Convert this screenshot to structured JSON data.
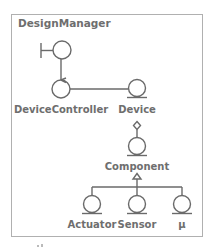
{
  "diagram": {
    "package_title": "DesignManager",
    "nodes": {
      "boundary": {
        "type": "boundary",
        "label": ""
      },
      "controller": {
        "type": "control",
        "label": "DeviceController"
      },
      "device": {
        "type": "entity",
        "label": "Device"
      },
      "component": {
        "type": "entity",
        "label": "Component"
      },
      "actuator": {
        "type": "entity",
        "label": "Actuator"
      },
      "sensor": {
        "type": "entity",
        "label": "Sensor"
      },
      "mu": {
        "type": "entity",
        "label": "μ"
      }
    },
    "edges": [
      {
        "from": "boundary",
        "to": "controller",
        "kind": "association"
      },
      {
        "from": "controller",
        "to": "device",
        "kind": "association"
      },
      {
        "from": "device",
        "to": "component",
        "kind": "aggregation"
      },
      {
        "from": "actuator",
        "to": "component",
        "kind": "generalization"
      },
      {
        "from": "sensor",
        "to": "component",
        "kind": "generalization"
      },
      {
        "from": "mu",
        "to": "component",
        "kind": "generalization"
      }
    ],
    "colors": {
      "line": "#6a6a6a",
      "text": "#6e6e6e",
      "border": "#b0b0b0"
    }
  }
}
